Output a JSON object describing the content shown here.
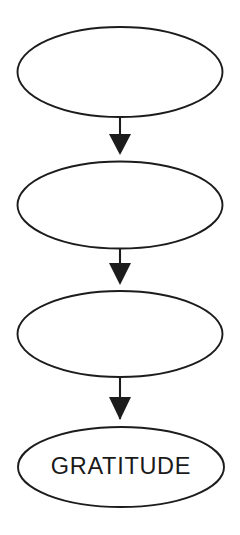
{
  "diagram": {
    "type": "flowchart",
    "orientation": "vertical-top-to-bottom",
    "background_color": "#ffffff",
    "stroke_color": "#1c1c1c",
    "text_color": "#1a1a1a",
    "nodes": [
      {
        "id": "node-1",
        "shape": "ellipse",
        "label": ""
      },
      {
        "id": "node-2",
        "shape": "ellipse",
        "label": ""
      },
      {
        "id": "node-3",
        "shape": "ellipse",
        "label": ""
      },
      {
        "id": "node-4",
        "shape": "ellipse",
        "label": "GRATITUDE"
      }
    ],
    "connectors": [
      {
        "id": "arrow-1",
        "from": "node-1",
        "to": "node-2",
        "style": "solid-filled-arrowhead",
        "direction": "down"
      },
      {
        "id": "arrow-2",
        "from": "node-2",
        "to": "node-3",
        "style": "solid-filled-arrowhead",
        "direction": "down"
      },
      {
        "id": "arrow-3",
        "from": "node-3",
        "to": "node-4",
        "style": "solid-filled-arrowhead",
        "direction": "down"
      }
    ]
  }
}
